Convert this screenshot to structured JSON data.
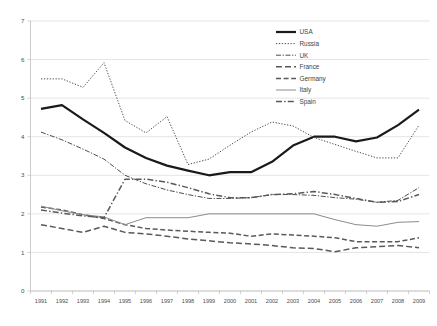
{
  "chart_data": {
    "type": "line",
    "title": "",
    "xlabel": "",
    "ylabel": "",
    "ylim": [
      0,
      7
    ],
    "ytick_step": 1,
    "grid": true,
    "legend_position": "upper-right-inside",
    "categories": [
      "1991",
      "1992",
      "1993",
      "1994",
      "1995",
      "1996",
      "1997",
      "1998",
      "1999",
      "2000",
      "2001",
      "2002",
      "2003",
      "2004",
      "2005",
      "2006",
      "2007",
      "2008",
      "2009"
    ],
    "yticks": [
      "0",
      "1",
      "2",
      "3",
      "4",
      "5",
      "6",
      "7"
    ],
    "series": [
      {
        "name": "USA",
        "style": "solid-thick",
        "color": "#1a1a1a",
        "values": [
          4.72,
          4.82,
          4.45,
          4.1,
          3.72,
          3.45,
          3.25,
          3.12,
          3.0,
          3.08,
          3.08,
          3.35,
          3.77,
          4.0,
          4.0,
          3.88,
          3.98,
          4.3,
          4.7
        ]
      },
      {
        "name": "Russia",
        "style": "dotted",
        "color": "#4d4d4d",
        "values": [
          5.5,
          5.5,
          5.28,
          5.92,
          4.42,
          4.1,
          4.52,
          3.28,
          3.42,
          3.78,
          4.12,
          4.38,
          4.28,
          3.98,
          3.8,
          3.62,
          3.45,
          3.45,
          4.3
        ]
      },
      {
        "name": "UK",
        "style": "dash-dot-fine",
        "color": "#4d4d4d",
        "values": [
          4.12,
          3.92,
          3.68,
          3.42,
          3.0,
          2.78,
          2.62,
          2.5,
          2.4,
          2.4,
          2.42,
          2.5,
          2.5,
          2.48,
          2.42,
          2.38,
          2.3,
          2.35,
          2.68
        ]
      },
      {
        "name": "France",
        "style": "long-dash",
        "color": "#595959",
        "values": [
          1.72,
          1.62,
          1.52,
          1.68,
          1.52,
          1.48,
          1.42,
          1.35,
          1.3,
          1.25,
          1.22,
          1.18,
          1.12,
          1.1,
          1.02,
          1.12,
          1.15,
          1.18,
          1.12
        ]
      },
      {
        "name": "Germany",
        "style": "dash",
        "color": "#595959",
        "values": [
          2.18,
          2.1,
          1.98,
          1.88,
          1.72,
          1.62,
          1.58,
          1.55,
          1.52,
          1.5,
          1.42,
          1.48,
          1.45,
          1.42,
          1.38,
          1.28,
          1.28,
          1.28,
          1.38
        ]
      },
      {
        "name": "Italy",
        "style": "solid-thin",
        "color": "#8c8c8c",
        "values": [
          2.2,
          2.08,
          1.98,
          1.92,
          1.72,
          1.9,
          1.9,
          1.9,
          2.0,
          2.0,
          2.0,
          2.0,
          2.0,
          2.0,
          1.85,
          1.72,
          1.68,
          1.78,
          1.8
        ]
      },
      {
        "name": "Spain",
        "style": "dash-dot",
        "color": "#595959",
        "values": [
          2.1,
          2.02,
          1.95,
          1.9,
          2.9,
          2.9,
          2.82,
          2.68,
          2.52,
          2.42,
          2.42,
          2.5,
          2.52,
          2.58,
          2.5,
          2.4,
          2.3,
          2.32,
          2.5
        ]
      }
    ]
  },
  "legend": {
    "entries": [
      {
        "label": "USA"
      },
      {
        "label": "Russia"
      },
      {
        "label": "UK"
      },
      {
        "label": "France"
      },
      {
        "label": "Germany"
      },
      {
        "label": "Italy"
      },
      {
        "label": "Spain"
      }
    ]
  }
}
